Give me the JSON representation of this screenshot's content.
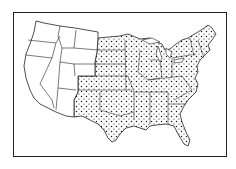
{
  "map": {
    "subject": "contiguous-united-states",
    "style": "line-drawing",
    "colors": {
      "background": "#ffffff",
      "ink": "#222222",
      "stipple": "#1a1a1a"
    },
    "frame": {
      "x": 13,
      "y": 12,
      "width": 214,
      "height": 145
    },
    "regions": [
      {
        "id": "west-unshaded",
        "fill": "none",
        "states": [
          "WA",
          "OR",
          "CA",
          "NV",
          "ID",
          "MT",
          "WY",
          "UT",
          "AZ"
        ]
      },
      {
        "id": "east-stippled",
        "fill": "dots",
        "states": [
          "ND",
          "SD",
          "NE",
          "KS",
          "OK",
          "TX",
          "CO",
          "NM",
          "MN",
          "IA",
          "MO",
          "AR",
          "LA",
          "WI",
          "IL",
          "MI",
          "IN",
          "OH",
          "KY",
          "TN",
          "MS",
          "AL",
          "GA",
          "FL",
          "SC",
          "NC",
          "VA",
          "WV",
          "PA",
          "NY",
          "VT",
          "NH",
          "ME",
          "MA",
          "CT",
          "RI",
          "NJ",
          "DE",
          "MD"
        ]
      }
    ]
  }
}
